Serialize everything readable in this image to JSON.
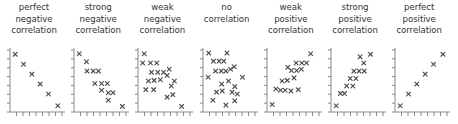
{
  "figure": {
    "marker_glyph": "x",
    "axis_color": "#8a8a8a",
    "marker_color": "#4d4d4d",
    "text_color": "#333333",
    "background": "#ffffff",
    "panel_width": 64,
    "panel_pitch": 64.2,
    "xticks": 8,
    "yticks": 7
  },
  "chart_data": {
    "type": "scatter",
    "title": "",
    "xlabel": "",
    "ylabel": "",
    "xlim": [
      0,
      10
    ],
    "ylim": [
      0,
      10
    ],
    "grid": false,
    "legend": "none",
    "axes_ticks": {
      "x": 8,
      "y": 7
    },
    "panels": [
      {
        "index": 0,
        "caption_lines": [
          "perfect",
          "negative",
          "correlation"
        ],
        "caption_text": "perfect negative correlation",
        "correlation": "perfect negative",
        "x": [
          1.0,
          2.6,
          4.2,
          5.8,
          7.4,
          9.2
        ],
        "y": [
          9.3,
          7.7,
          6.1,
          4.5,
          2.9,
          1.0
        ]
      },
      {
        "index": 1,
        "caption_lines": [
          "strong",
          "negative",
          "correlation"
        ],
        "caption_text": "strong negative correlation",
        "correlation": "strong negative",
        "x": [
          1.0,
          2.4,
          2.5,
          3.7,
          4.7,
          4.0,
          5.3,
          6.4,
          5.3,
          6.6,
          7.5,
          6.6,
          9.3
        ],
        "y": [
          9.4,
          8.1,
          6.6,
          6.6,
          6.6,
          4.6,
          4.6,
          4.6,
          3.5,
          3.1,
          3.1,
          1.9,
          0.9
        ]
      },
      {
        "index": 2,
        "caption_lines": [
          "weak",
          "negative",
          "correlation"
        ],
        "caption_text": "weak negative correlation",
        "correlation": "weak negative",
        "x": [
          1.2,
          0.9,
          2.4,
          3.6,
          2.6,
          3.8,
          4.9,
          6.0,
          2.0,
          3.1,
          4.3,
          5.6,
          1.5,
          3.0,
          6.4,
          7.0,
          5.6,
          6.7,
          8.4
        ],
        "y": [
          9.4,
          7.9,
          7.9,
          7.9,
          6.4,
          6.4,
          6.4,
          6.9,
          5.0,
          5.1,
          5.2,
          5.9,
          3.6,
          3.6,
          4.2,
          5.0,
          2.4,
          2.8,
          0.9
        ]
      },
      {
        "index": 3,
        "caption_lines": [
          "no",
          "correlation"
        ],
        "caption_text": "no correlation",
        "correlation": "none",
        "x": [
          1.1,
          4.6,
          2.0,
          3.1,
          4.0,
          6.0,
          2.4,
          3.5,
          4.4,
          5.3,
          1.0,
          7.6,
          3.6,
          4.9,
          6.1,
          2.6,
          3.7,
          5.6,
          6.6,
          1.9,
          4.4,
          6.1
        ],
        "y": [
          9.5,
          9.5,
          8.2,
          8.2,
          8.2,
          7.3,
          6.6,
          6.6,
          6.6,
          6.9,
          5.6,
          5.6,
          4.5,
          5.0,
          4.1,
          3.2,
          3.4,
          3.2,
          2.9,
          1.9,
          1.1,
          1.8
        ]
      },
      {
        "index": 4,
        "caption_lines": [
          "weak",
          "positive",
          "correlation"
        ],
        "caption_text": "weak positive correlation",
        "correlation": "weak positive",
        "x": [
          8.4,
          4.0,
          5.6,
          6.7,
          7.6,
          4.7,
          5.7,
          6.6,
          2.9,
          3.9,
          5.2,
          1.7,
          2.6,
          3.5,
          4.6,
          6.0,
          1.0
        ],
        "y": [
          9.4,
          7.2,
          7.9,
          7.9,
          7.9,
          6.7,
          6.7,
          6.9,
          5.0,
          5.1,
          5.5,
          3.7,
          3.5,
          3.5,
          3.4,
          3.6,
          1.2
        ]
      },
      {
        "index": 5,
        "caption_lines": [
          "strong",
          "positive",
          "correlation"
        ],
        "caption_text": "strong positive correlation",
        "correlation": "strong positive",
        "x": [
          5.6,
          7.6,
          6.3,
          4.4,
          5.4,
          6.4,
          3.7,
          4.8,
          3.0,
          4.2,
          1.8,
          2.6,
          1.0
        ],
        "y": [
          8.9,
          9.3,
          7.9,
          6.6,
          6.6,
          6.6,
          5.4,
          5.4,
          4.2,
          4.2,
          3.0,
          3.0,
          1.0
        ]
      },
      {
        "index": 6,
        "caption_lines": [
          "perfect",
          "positive",
          "correlation"
        ],
        "caption_text": "perfect positive correlation",
        "correlation": "perfect positive",
        "x": [
          1.0,
          2.6,
          4.2,
          5.8,
          7.4,
          9.2
        ],
        "y": [
          1.0,
          2.9,
          4.5,
          6.1,
          7.7,
          9.3
        ]
      }
    ]
  }
}
